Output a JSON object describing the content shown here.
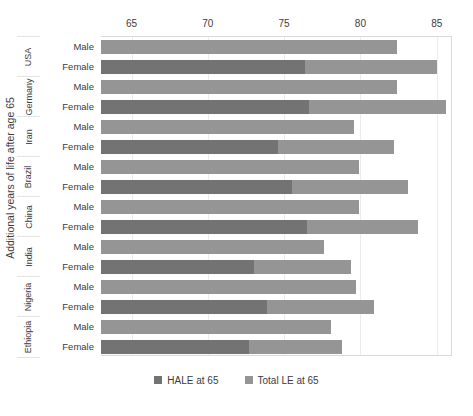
{
  "chart_data": {
    "type": "bar",
    "orientation": "horizontal",
    "title": "",
    "xlabel": "",
    "ylabel": "Additional years of life after age 65",
    "xlim": [
      63.0,
      86.0
    ],
    "xticks": [
      65,
      70,
      75,
      80,
      85
    ],
    "grid": true,
    "legend_position": "bottom",
    "bar_mode": "overlay",
    "legend": [
      "HALE at 65",
      "Total LE at 65"
    ],
    "colors": {
      "hale": "#737373",
      "le": "#959595",
      "grid": "#ececec",
      "axis_text": "#3c3c3c",
      "plot_border": "#d9d9d9"
    },
    "groups": [
      "USA",
      "Germany",
      "Iran",
      "Brazil",
      "China",
      "India",
      "Nigeria",
      "Ethiopia"
    ],
    "subcategories": [
      "Male",
      "Female"
    ],
    "series": [
      {
        "name": "HALE at 65",
        "values": [
          63.0,
          76.4,
          63.0,
          76.6,
          63.0,
          74.6,
          63.0,
          75.5,
          63.0,
          76.5,
          63.0,
          73.0,
          63.0,
          73.9,
          63.0,
          72.7
        ]
      },
      {
        "name": "Total LE at 65",
        "values": [
          82.4,
          85.0,
          82.4,
          85.6,
          79.6,
          82.2,
          79.9,
          83.1,
          79.9,
          83.8,
          77.6,
          79.4,
          79.7,
          80.9,
          78.1,
          78.8
        ]
      }
    ],
    "rows": [
      {
        "group": "USA",
        "sub": "Male",
        "hale": 63.0,
        "le": 82.4
      },
      {
        "group": "USA",
        "sub": "Female",
        "hale": 76.4,
        "le": 85.0
      },
      {
        "group": "Germany",
        "sub": "Male",
        "hale": 63.0,
        "le": 82.4
      },
      {
        "group": "Germany",
        "sub": "Female",
        "hale": 76.6,
        "le": 85.6
      },
      {
        "group": "Iran",
        "sub": "Male",
        "hale": 63.0,
        "le": 79.6
      },
      {
        "group": "Iran",
        "sub": "Female",
        "hale": 74.6,
        "le": 82.2
      },
      {
        "group": "Brazil",
        "sub": "Male",
        "hale": 63.0,
        "le": 79.9
      },
      {
        "group": "Brazil",
        "sub": "Female",
        "hale": 75.5,
        "le": 83.1
      },
      {
        "group": "China",
        "sub": "Male",
        "hale": 63.0,
        "le": 79.9
      },
      {
        "group": "China",
        "sub": "Female",
        "hale": 76.5,
        "le": 83.8
      },
      {
        "group": "India",
        "sub": "Male",
        "hale": 63.0,
        "le": 77.6
      },
      {
        "group": "India",
        "sub": "Female",
        "hale": 73.0,
        "le": 79.4
      },
      {
        "group": "Nigeria",
        "sub": "Male",
        "hale": 63.0,
        "le": 79.7
      },
      {
        "group": "Nigeria",
        "sub": "Female",
        "hale": 73.9,
        "le": 80.9
      },
      {
        "group": "Ethiopia",
        "sub": "Male",
        "hale": 63.0,
        "le": 78.1
      },
      {
        "group": "Ethiopia",
        "sub": "Female",
        "hale": 72.7,
        "le": 78.8
      }
    ]
  }
}
